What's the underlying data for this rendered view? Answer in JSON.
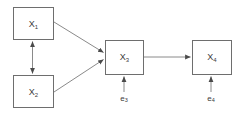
{
  "diagram": {
    "type": "path-diagram",
    "background_color": "#ffffff",
    "box_stroke_color": "#6e6e6e",
    "edge_stroke_color": "#8a8a8a",
    "label_color": "#3a3a3a",
    "nodes": [
      {
        "id": "x1",
        "base": "X",
        "subscript": "1",
        "label": "X1",
        "shape": "rectangle",
        "x": 13,
        "y": 7,
        "width": 41,
        "height": 33
      },
      {
        "id": "x2",
        "base": "X",
        "subscript": "2",
        "label": "X2",
        "shape": "rectangle",
        "x": 13,
        "y": 75,
        "width": 41,
        "height": 33
      },
      {
        "id": "x3",
        "base": "X",
        "subscript": "3",
        "label": "X3",
        "shape": "rectangle",
        "x": 105,
        "y": 40,
        "width": 39,
        "height": 35
      },
      {
        "id": "x4",
        "base": "X",
        "subscript": "4",
        "label": "X4",
        "shape": "rectangle",
        "x": 192,
        "y": 40,
        "width": 40,
        "height": 35
      }
    ],
    "error_terms": [
      {
        "id": "e3",
        "base": "e",
        "subscript": "3",
        "label": "e3",
        "target": "x3",
        "x": 124,
        "y": 99
      },
      {
        "id": "e4",
        "base": "e",
        "subscript": "4",
        "label": "e4",
        "target": "x4",
        "x": 211,
        "y": 99
      }
    ],
    "edges": [
      {
        "id": "edge-x1-x3",
        "from": "x1",
        "to": "x3",
        "arrow": "single",
        "direction": "forward",
        "style": "straight"
      },
      {
        "id": "edge-x2-x3",
        "from": "x2",
        "to": "x3",
        "arrow": "single",
        "direction": "forward",
        "style": "straight"
      },
      {
        "id": "edge-x1-x2",
        "from": "x1",
        "to": "x2",
        "arrow": "double",
        "direction": "bidirectional",
        "style": "straight"
      },
      {
        "id": "edge-x3-x4",
        "from": "x3",
        "to": "x4",
        "arrow": "single",
        "direction": "forward",
        "style": "straight"
      },
      {
        "id": "edge-e3-x3",
        "from": "e3",
        "to": "x3",
        "arrow": "single",
        "direction": "forward",
        "style": "straight"
      },
      {
        "id": "edge-e4-x4",
        "from": "e4",
        "to": "x4",
        "arrow": "single",
        "direction": "forward",
        "style": "straight"
      }
    ]
  }
}
